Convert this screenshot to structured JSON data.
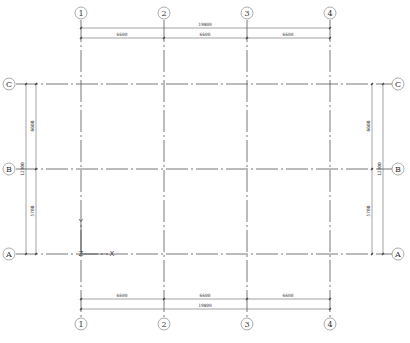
{
  "drawing": {
    "type": "structural axis grid plan",
    "vertical_axes": [
      {
        "label": "1",
        "x": 81
      },
      {
        "label": "2",
        "x": 164
      },
      {
        "label": "3",
        "x": 247
      },
      {
        "label": "4",
        "x": 330
      }
    ],
    "horizontal_axes": [
      {
        "label": "C",
        "y": 84
      },
      {
        "label": "B",
        "y": 169
      },
      {
        "label": "A",
        "y": 254
      }
    ],
    "top_dimensions": {
      "total": "19800",
      "spans": [
        "6600",
        "6600",
        "6600"
      ]
    },
    "bottom_dimensions": {
      "total": "19800",
      "spans": [
        "6600",
        "6600",
        "6600"
      ]
    },
    "left_dimensions": {
      "total": "12300",
      "spans": [
        "6600",
        "5700"
      ]
    },
    "right_dimensions": {
      "total": "12300",
      "spans": [
        "6600",
        "5700"
      ]
    },
    "ucs_icon": {
      "x_label": "X",
      "y_label": "Y",
      "z_label": "Z"
    }
  }
}
